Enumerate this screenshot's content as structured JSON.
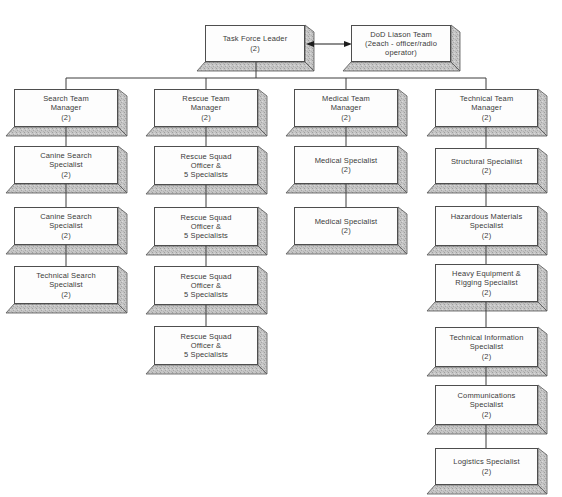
{
  "org_chart": {
    "root": {
      "lines": [
        "Task Force Leader",
        "(2)"
      ]
    },
    "liaison": {
      "lines": [
        "DoD Liason Team",
        "(2each - officer/radio",
        "operator)"
      ]
    },
    "columns": [
      {
        "manager": {
          "lines": [
            "Search Team",
            "Manager",
            "(2)"
          ]
        },
        "subordinates": [
          {
            "lines": [
              "Canine Search",
              "Specialist",
              "(2)"
            ]
          },
          {
            "lines": [
              "Canine Search",
              "Specialist",
              "(2)"
            ]
          },
          {
            "lines": [
              "Technical Search",
              "Specialist",
              "(2)"
            ]
          }
        ]
      },
      {
        "manager": {
          "lines": [
            "Rescue Team",
            "Manager",
            "(2)"
          ]
        },
        "subordinates": [
          {
            "lines": [
              "Rescue Squad",
              "Officer &",
              "5 Specialists"
            ]
          },
          {
            "lines": [
              "Rescue Squad",
              "Officer &",
              "5 Specialists"
            ]
          },
          {
            "lines": [
              "Rescue Squad",
              "Officer &",
              "5 Specialists"
            ]
          },
          {
            "lines": [
              "Rescue Squad",
              "Officer &",
              "5 Specialists"
            ]
          }
        ]
      },
      {
        "manager": {
          "lines": [
            "Medical Team",
            "Manager",
            "(2)"
          ]
        },
        "subordinates": [
          {
            "lines": [
              "Medical Specialist",
              "(2)"
            ]
          },
          {
            "lines": [
              "Medical Specialist",
              "(2)"
            ]
          }
        ]
      },
      {
        "manager": {
          "lines": [
            "Technical Team",
            "Manager",
            "(2)"
          ]
        },
        "subordinates": [
          {
            "lines": [
              "Structural Specialiist",
              "(2)"
            ]
          },
          {
            "lines": [
              "Hazardous Materials",
              "Specialist",
              "(2)"
            ]
          },
          {
            "lines": [
              "Heavy Equipment &",
              "Rigging Specialist",
              "(2)"
            ]
          },
          {
            "lines": [
              "Technical Information",
              "Specialist",
              "(2)"
            ]
          },
          {
            "lines": [
              "Communications",
              "Specialist",
              "(2)"
            ]
          },
          {
            "lines": [
              "Logistics Specialist",
              "(2)"
            ]
          }
        ]
      }
    ]
  },
  "colors": {
    "background": "#ffffff",
    "box_face": "#fdfdfd",
    "box_border": "#4e4e4e",
    "bevel_fill": "#c6c6c6",
    "connector": "#3d3d3d",
    "arrow": "#1d1d1d",
    "text": "#3b3b3b"
  }
}
